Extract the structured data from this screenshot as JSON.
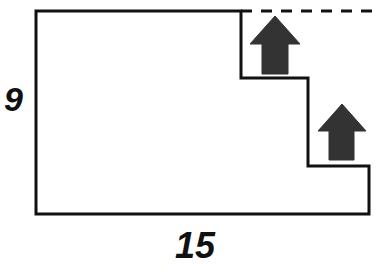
{
  "figure": {
    "kind": "composite-rectilinear-polygon",
    "background_color": "#ffffff",
    "outline_color": "#111111",
    "outline_width_px": 3,
    "dashed_color": "#111111",
    "arrow_color": "#333333",
    "canvas": {
      "width": 376,
      "height": 276
    },
    "labels": {
      "height": "9",
      "width": "15"
    },
    "outline_points": "36,11 241,11 241,78 308,78 308,166 369,166 369,214 36,214",
    "dashed_segment": {
      "x1": 241,
      "y1": 11,
      "x2": 376,
      "y2": 11,
      "dash": "11 9"
    },
    "arrows": [
      {
        "name": "step-arrow-upper",
        "direction": "up",
        "points": "275,16 300,44 288,44 288,74 262,74 262,44 250,44"
      },
      {
        "name": "step-arrow-lower",
        "direction": "up",
        "points": "342,104 366,131 354,131 354,160 329,160 329,131 318,131"
      }
    ]
  }
}
